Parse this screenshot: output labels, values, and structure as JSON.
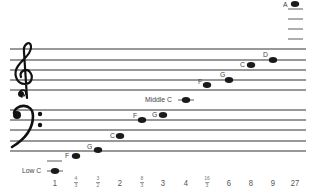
{
  "diagram": {
    "title": "",
    "treble_clef": "treble-clef",
    "bass_clef": "bass-clef",
    "staff_color": "#222222",
    "note_color": "#1a1a1a",
    "notes": [
      {
        "label": "Low C",
        "x": 55,
        "y": 171,
        "ratio": "1"
      },
      {
        "label": "F",
        "x": 76,
        "y": 156,
        "ratio": "4/3"
      },
      {
        "label": "G",
        "x": 98,
        "y": 150,
        "ratio": "3/2"
      },
      {
        "label": "C",
        "x": 120,
        "y": 136,
        "ratio": "2"
      },
      {
        "label": "F",
        "x": 142,
        "y": 120,
        "ratio": "8/3"
      },
      {
        "label": "G",
        "x": 163,
        "y": 115,
        "ratio": "3"
      },
      {
        "label": "Middle C",
        "x": 186,
        "y": 100,
        "ratio": "4"
      },
      {
        "label": "F",
        "x": 207,
        "y": 85,
        "ratio": "16/3"
      },
      {
        "label": "G",
        "x": 229,
        "y": 80,
        "ratio": "6"
      },
      {
        "label": "C",
        "x": 251,
        "y": 65,
        "ratio": "8"
      },
      {
        "label": "D",
        "x": 273,
        "y": 60,
        "ratio": "9"
      },
      {
        "label": "A",
        "x": 295,
        "y": 4,
        "ratio": "27"
      }
    ],
    "ratios": [
      {
        "type": "int",
        "value": "1",
        "x": 55
      },
      {
        "type": "frac",
        "num": "4",
        "den": "3",
        "x": 76
      },
      {
        "type": "frac",
        "num": "3",
        "den": "2",
        "x": 98
      },
      {
        "type": "int",
        "value": "2",
        "x": 120
      },
      {
        "type": "frac",
        "num": "8",
        "den": "3",
        "x": 142
      },
      {
        "type": "int",
        "value": "3",
        "x": 163
      },
      {
        "type": "int",
        "value": "4",
        "x": 186
      },
      {
        "type": "frac",
        "num": "16",
        "den": "3",
        "x": 207
      },
      {
        "type": "int",
        "value": "6",
        "x": 229
      },
      {
        "type": "int",
        "value": "8",
        "x": 251
      },
      {
        "type": "int",
        "value": "9",
        "x": 273
      },
      {
        "type": "int",
        "value": "27",
        "x": 295
      }
    ]
  }
}
